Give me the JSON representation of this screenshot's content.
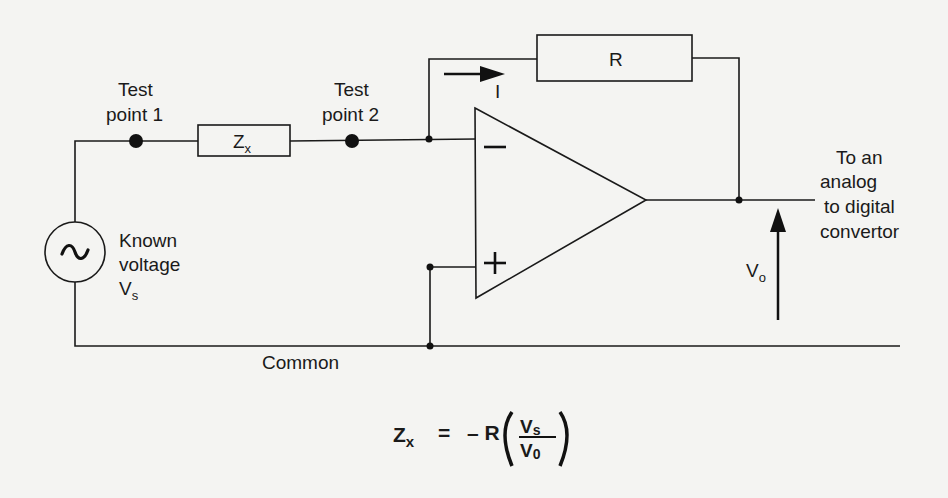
{
  "diagram": {
    "type": "circuit-schematic",
    "labels": {
      "test_point_1_line1": "Test",
      "test_point_1_line2": "point 1",
      "test_point_2_line1": "Test",
      "test_point_2_line2": "point 2",
      "zx_main": "Z",
      "zx_sub": "x",
      "r_label": "R",
      "current_label": "I",
      "opamp_minus": "−",
      "opamp_plus": "+",
      "source_symbol": "~",
      "source_line1": "Known",
      "source_line2": "voltage",
      "source_line3_main": "V",
      "source_line3_sub": "s",
      "output_line1": "To an",
      "output_line2": "analog",
      "output_line3": "to digital",
      "output_line4": "convertor",
      "vo_main": "V",
      "vo_sub": "o",
      "common": "Common"
    },
    "formula": {
      "lhs_main": "Z",
      "lhs_sub": "x",
      "equals": "=",
      "minus_r": "– R",
      "num_main": "V",
      "num_sub": "s",
      "den_main": "V",
      "den_sub": "0",
      "open_paren": "(",
      "close_paren": ")"
    },
    "components": [
      {
        "id": "Vs",
        "kind": "ac-voltage-source",
        "label": "Known voltage Vs"
      },
      {
        "id": "Zx",
        "kind": "impedance",
        "label": "Zx"
      },
      {
        "id": "R",
        "kind": "feedback-resistor",
        "label": "R"
      },
      {
        "id": "U1",
        "kind": "op-amp",
        "inputs": [
          "−",
          "+"
        ]
      }
    ],
    "colors": {
      "background": "#f4f4f2",
      "ink": "#1a1a1a"
    }
  }
}
